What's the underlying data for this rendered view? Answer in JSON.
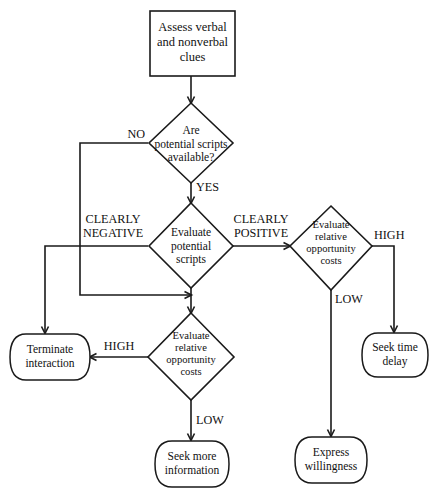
{
  "diagram": {
    "type": "flowchart",
    "canvas": {
      "width": 443,
      "height": 493
    },
    "stroke_color": "#1a1a1a",
    "fill_color": "#ffffff",
    "nodes": [
      {
        "id": "assess",
        "shape": "process",
        "label": "Assess verbal\nand nonverbal\nclues"
      },
      {
        "id": "scripts-available",
        "shape": "decision",
        "label": "Are\npotential scripts\navailable?"
      },
      {
        "id": "evaluate-scripts",
        "shape": "decision",
        "label": "Evaluate\npotential\nscripts"
      },
      {
        "id": "evaluate-costs-right",
        "shape": "decision",
        "label": "Evaluate\nrelative\nopportunity\ncosts"
      },
      {
        "id": "evaluate-costs-lower",
        "shape": "decision",
        "label": "Evaluate\nrelative\nopportunity\ncosts"
      },
      {
        "id": "terminate",
        "shape": "terminator",
        "label": "Terminate\ninteraction"
      },
      {
        "id": "seek-time-delay",
        "shape": "terminator",
        "label": "Seek time\ndelay"
      },
      {
        "id": "seek-more-info",
        "shape": "terminator",
        "label": "Seek more\ninformation"
      },
      {
        "id": "express-willingness",
        "shape": "terminator",
        "label": "Express\nwillingness"
      }
    ],
    "edge_labels": [
      {
        "id": "no",
        "text": "NO"
      },
      {
        "id": "yes",
        "text": "YES"
      },
      {
        "id": "clearly-negative",
        "text": "CLEARLY\nNEGATIVE"
      },
      {
        "id": "clearly-positive",
        "text": "CLEARLY\nPOSITIVE"
      },
      {
        "id": "high-right",
        "text": "HIGH"
      },
      {
        "id": "low-right",
        "text": "LOW"
      },
      {
        "id": "high-left",
        "text": "HIGH"
      },
      {
        "id": "low-lower",
        "text": "LOW"
      }
    ]
  }
}
